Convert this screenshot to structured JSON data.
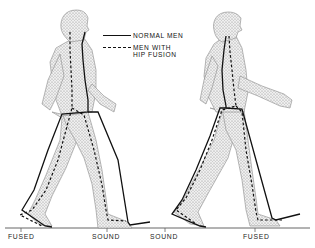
{
  "legend": {
    "items": [
      {
        "style": "solid",
        "label": "NORMAL MEN"
      },
      {
        "style": "dashed",
        "label_line1": "MEN WITH",
        "label_line2": "HIP FUSION"
      }
    ]
  },
  "figures": [
    {
      "name": "left-walker",
      "stance_leg": "fused",
      "swing_leg": "sound"
    },
    {
      "name": "right-walker",
      "stance_leg": "sound",
      "swing_leg": "fused"
    }
  ],
  "ground_labels": [
    {
      "text": "FUSED",
      "x": 8
    },
    {
      "text": "SOUND",
      "x": 92
    },
    {
      "text": "SOUND",
      "x": 150
    },
    {
      "text": "FUSED",
      "x": 243
    }
  ],
  "colors": {
    "line": "#111111",
    "body_fill": "#d8d8d8",
    "body_stroke": "#8a8a8a",
    "ground": "#555555"
  }
}
